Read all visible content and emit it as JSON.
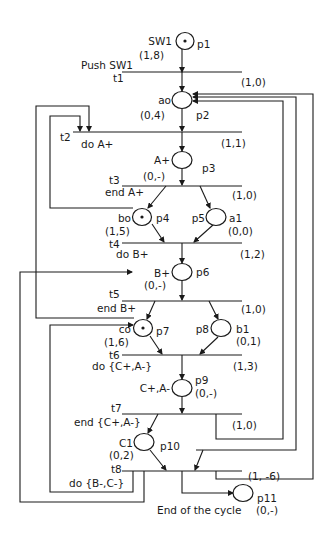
{
  "diagram": {
    "type": "petri-net",
    "places": [
      {
        "id": "p1",
        "name": "SW1",
        "marking": "(1,8)",
        "token": true
      },
      {
        "id": "p2",
        "name": "ao",
        "marking": "(0,4)",
        "token": false
      },
      {
        "id": "p3",
        "name": "A+",
        "marking": "(0,-)",
        "token": false
      },
      {
        "id": "p4",
        "name": "bo",
        "marking": "(1,5)",
        "token": true
      },
      {
        "id": "p5",
        "name": "a1",
        "marking": "(0,0)",
        "token": false
      },
      {
        "id": "p6",
        "name": "B+",
        "marking": "(0,-)",
        "token": false
      },
      {
        "id": "p7",
        "name": "co",
        "marking": "(1,6)",
        "token": true
      },
      {
        "id": "p8",
        "name": "b1",
        "marking": "(0,1)",
        "token": false
      },
      {
        "id": "p9",
        "name": "C+,A-",
        "marking": "(0,-)",
        "token": false
      },
      {
        "id": "p10",
        "name": "C1",
        "marking": "(0,2)",
        "token": false
      },
      {
        "id": "p11",
        "name": "End of the cycle",
        "marking": "(0,-)",
        "token": false
      }
    ],
    "transitions": [
      {
        "id": "t1",
        "name": "Push SW1",
        "value": "(1,0)"
      },
      {
        "id": "t2",
        "name": "do A+",
        "value": "(1,1)"
      },
      {
        "id": "t3",
        "name": "end A+",
        "value": "(1,0)"
      },
      {
        "id": "t4",
        "name": "do B+",
        "value": "(1,2)"
      },
      {
        "id": "t5",
        "name": "end B+",
        "value": "(1,0)"
      },
      {
        "id": "t6",
        "name": "do {C+,A-}",
        "value": "(1,3)"
      },
      {
        "id": "t7",
        "name": "end {C+,A-}",
        "value": "(1,0)"
      },
      {
        "id": "t8",
        "name": "do {B-,C-}",
        "value": "(1, -6)"
      }
    ]
  }
}
